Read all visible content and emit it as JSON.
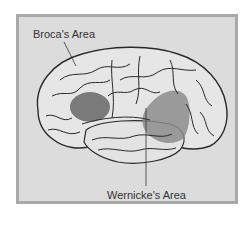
{
  "diagram": {
    "labels": {
      "broca": "Broca's Area",
      "wernicke": "Wernicke's Area"
    },
    "colors": {
      "background": "#ffffff",
      "panel_fill": "#dcdcdc",
      "panel_border": "#a9a9a9",
      "brain_fill": "#e6e6e6",
      "outline": "#2a2a2a",
      "broca_shade": "#6e6e6e",
      "wernicke_shade": "#8c8c8c"
    }
  }
}
